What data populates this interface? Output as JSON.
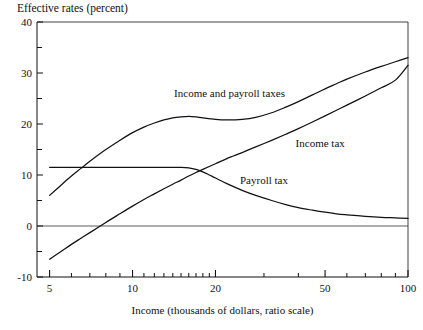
{
  "chart_data": {
    "type": "line",
    "title": "Effective rates (percent)",
    "xlabel": "Income (thousands of dollars, ratio scale)",
    "ylabel": "Effective rates (percent)",
    "xscale": "log",
    "xlim": [
      4.5,
      100
    ],
    "ylim": [
      -10,
      40
    ],
    "grid": false,
    "legend": "inline-annotations",
    "y_ticks_major": [
      "-10",
      "0",
      "10",
      "20",
      "30",
      "40"
    ],
    "y_ticks_minor": [
      -5,
      5,
      15,
      25,
      35
    ],
    "x_ticks_labeled": [
      "5",
      "10",
      "20",
      "50",
      "100"
    ],
    "x_ticks_minor": [
      6,
      7,
      8,
      9,
      11,
      12,
      13,
      14,
      15,
      16,
      17,
      18,
      19,
      30,
      40,
      60,
      70,
      80,
      90
    ],
    "zero_line": 0,
    "series": [
      {
        "name": "Income and payroll taxes",
        "label": "Income and payroll taxes",
        "label_x": 22.5,
        "label_y": 25.2,
        "points": [
          [
            5,
            6.0
          ],
          [
            5.5,
            8.0
          ],
          [
            6,
            9.8
          ],
          [
            6.5,
            11.3
          ],
          [
            7,
            12.7
          ],
          [
            8,
            15.0
          ],
          [
            9,
            16.8
          ],
          [
            10,
            18.3
          ],
          [
            11,
            19.4
          ],
          [
            12,
            20.2
          ],
          [
            13,
            20.8
          ],
          [
            14,
            21.2
          ],
          [
            15,
            21.4
          ],
          [
            16,
            21.5
          ],
          [
            17,
            21.4
          ],
          [
            18,
            21.2
          ],
          [
            20,
            20.9
          ],
          [
            22,
            20.8
          ],
          [
            25,
            20.9
          ],
          [
            28,
            21.3
          ],
          [
            32,
            22.2
          ],
          [
            36,
            23.3
          ],
          [
            40,
            24.4
          ],
          [
            45,
            25.7
          ],
          [
            50,
            26.9
          ],
          [
            55,
            27.9
          ],
          [
            60,
            28.8
          ],
          [
            70,
            30.2
          ],
          [
            80,
            31.3
          ],
          [
            90,
            32.2
          ],
          [
            100,
            33.0
          ]
        ]
      },
      {
        "name": "Income tax",
        "label": "Income tax",
        "label_x": 48,
        "label_y": 15.5,
        "points": [
          [
            5,
            -6.5
          ],
          [
            5.5,
            -5.0
          ],
          [
            6,
            -3.6
          ],
          [
            6.5,
            -2.4
          ],
          [
            7,
            -1.3
          ],
          [
            8,
            0.7
          ],
          [
            9,
            2.4
          ],
          [
            10,
            3.9
          ],
          [
            11,
            5.2
          ],
          [
            12,
            6.3
          ],
          [
            13,
            7.3
          ],
          [
            14,
            8.2
          ],
          [
            15,
            9.0
          ],
          [
            16,
            9.8
          ],
          [
            17,
            10.5
          ],
          [
            18,
            11.1
          ],
          [
            20,
            12.2
          ],
          [
            22,
            13.2
          ],
          [
            25,
            14.4
          ],
          [
            28,
            15.5
          ],
          [
            32,
            16.8
          ],
          [
            36,
            18.0
          ],
          [
            40,
            19.1
          ],
          [
            45,
            20.4
          ],
          [
            50,
            21.6
          ],
          [
            55,
            22.7
          ],
          [
            60,
            23.7
          ],
          [
            70,
            25.5
          ],
          [
            80,
            27.1
          ],
          [
            90,
            28.6
          ],
          [
            100,
            31.5
          ]
        ]
      },
      {
        "name": "Payroll tax",
        "label": "Payroll tax",
        "label_x": 30,
        "label_y": 8.2,
        "points": [
          [
            5,
            11.5
          ],
          [
            7,
            11.5
          ],
          [
            9,
            11.5
          ],
          [
            11,
            11.5
          ],
          [
            13,
            11.5
          ],
          [
            15,
            11.5
          ],
          [
            16,
            11.4
          ],
          [
            17,
            11.1
          ],
          [
            18,
            10.6
          ],
          [
            19,
            10.0
          ],
          [
            20,
            9.4
          ],
          [
            22,
            8.3
          ],
          [
            25,
            7.0
          ],
          [
            28,
            6.0
          ],
          [
            32,
            5.0
          ],
          [
            36,
            4.2
          ],
          [
            40,
            3.6
          ],
          [
            45,
            3.1
          ],
          [
            50,
            2.7
          ],
          [
            55,
            2.4
          ],
          [
            60,
            2.2
          ],
          [
            70,
            1.9
          ],
          [
            80,
            1.7
          ],
          [
            90,
            1.6
          ],
          [
            100,
            1.5
          ]
        ]
      }
    ]
  }
}
